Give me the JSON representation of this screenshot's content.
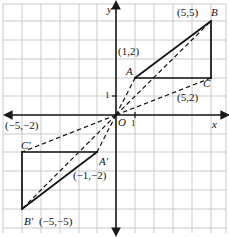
{
  "diagram": {
    "axes": {
      "x_label": "x",
      "y_label": "y",
      "x_tick_label": "1",
      "y_tick_label": "1",
      "origin_label": "O"
    },
    "grid": {
      "spacing_px": 19,
      "origin_px": {
        "x": 116,
        "y": 115
      },
      "color": "#c9c9c9",
      "visible": true
    },
    "colors": {
      "grid": "#c9c9c9",
      "axis": "#1a1a1a",
      "solid_stroke": "#111111",
      "dashed_stroke": "#111111",
      "text": "#111111"
    },
    "points": [
      {
        "id": "A",
        "name": "A",
        "coord_text": "(1,2)",
        "x": 1,
        "y": 2,
        "name_pos": {
          "x": 126,
          "y": 66
        },
        "coord_pos": {
          "x": 118,
          "y": 46
        }
      },
      {
        "id": "B",
        "name": "B",
        "coord_text": "(5,5)",
        "x": 5,
        "y": 5,
        "name_pos": {
          "x": 211,
          "y": 7
        },
        "coord_pos": {
          "x": 177,
          "y": 7
        }
      },
      {
        "id": "C",
        "name": "C",
        "coord_text": "(5,2)",
        "x": 5,
        "y": 2,
        "name_pos": {
          "x": 203,
          "y": 78
        },
        "coord_pos": {
          "x": 177,
          "y": 92
        }
      },
      {
        "id": "Ap",
        "name": "A′",
        "coord_text": "(−1,−2)",
        "x": -1,
        "y": -2,
        "name_pos": {
          "x": 99,
          "y": 156
        },
        "coord_pos": {
          "x": 73,
          "y": 170
        }
      },
      {
        "id": "Bp",
        "name": "B′",
        "coord_text": "(−5,−5)",
        "x": -5,
        "y": -5,
        "name_pos": {
          "x": 24,
          "y": 216
        },
        "coord_pos": {
          "x": 39,
          "y": 216
        }
      },
      {
        "id": "Cp",
        "name": "C′",
        "coord_text": "(−5,−2)",
        "x": -5,
        "y": -2,
        "name_pos": {
          "x": 21,
          "y": 140
        },
        "coord_pos": {
          "x": 5,
          "y": 120
        }
      }
    ],
    "solid_segments": [
      {
        "from": "A",
        "to": "B",
        "note": "side AB of upper triangle"
      },
      {
        "from": "B",
        "to": "C",
        "note": "vertical right edge, B down to C"
      },
      {
        "from": "A",
        "to": "C",
        "note": "horizontal base A to C"
      },
      {
        "from": "Ap",
        "to": "Bp",
        "note": "side A'B' of lower triangle"
      },
      {
        "from": "Bp",
        "to": "Cp",
        "note": "vertical left edge, B' up to C'"
      },
      {
        "from": "Ap",
        "to": "Cp",
        "note": "horizontal base A' to C'"
      }
    ],
    "dashed_segments": [
      {
        "from": "O",
        "to": "B",
        "note": "ray from origin through B"
      },
      {
        "from": "O",
        "to": "C",
        "note": "ray from origin through C"
      },
      {
        "from": "O",
        "to": "A",
        "note": "ray from origin through A"
      },
      {
        "from": "O",
        "to": "Bp",
        "note": "ray from origin through B'"
      },
      {
        "from": "O",
        "to": "Cp",
        "note": "ray from origin through C'"
      },
      {
        "from": "O",
        "to": "Ap",
        "note": "ray from origin through A'"
      }
    ]
  }
}
